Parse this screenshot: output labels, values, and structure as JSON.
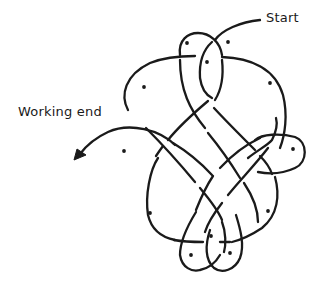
{
  "diagram": {
    "type": "knot-tying diagram",
    "labels": {
      "start": "Start",
      "working_end": "Working end"
    },
    "colors": {
      "line": "#1a1a1a",
      "background": "#ffffff"
    },
    "markers": {
      "dots": [
        {
          "x": 187,
          "y": 43
        },
        {
          "x": 228,
          "y": 42
        },
        {
          "x": 207,
          "y": 62
        },
        {
          "x": 144,
          "y": 87
        },
        {
          "x": 270,
          "y": 83
        },
        {
          "x": 124,
          "y": 151
        },
        {
          "x": 293,
          "y": 149
        },
        {
          "x": 150,
          "y": 213
        },
        {
          "x": 268,
          "y": 211
        },
        {
          "x": 211,
          "y": 236
        },
        {
          "x": 191,
          "y": 255
        },
        {
          "x": 230,
          "y": 253
        }
      ],
      "arrow": {
        "x": 78,
        "y": 156,
        "direction": "down-left"
      }
    }
  }
}
